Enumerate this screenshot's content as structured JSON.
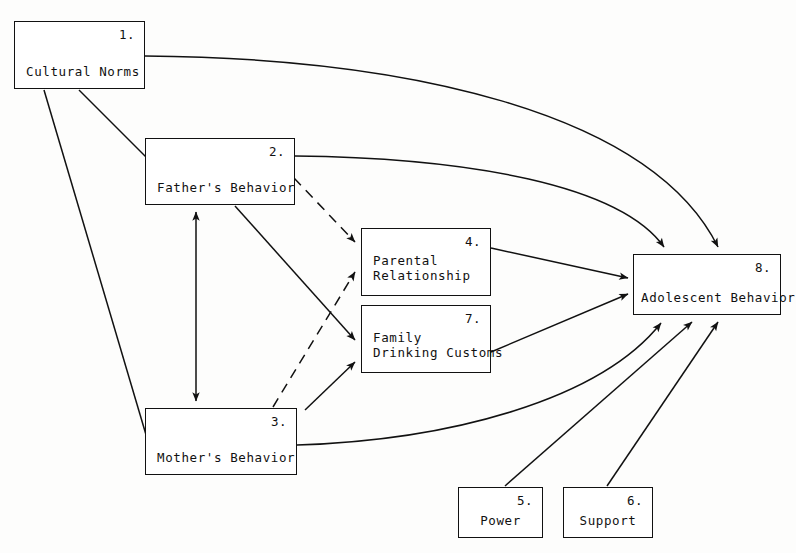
{
  "diagram": {
    "background_color": "#fdfdfc",
    "line_color": "#111111",
    "nodes": [
      {
        "id": "n1",
        "number": "1.",
        "label": "Cultural Norms",
        "x": 14,
        "y": 21,
        "w": 131,
        "h": 68
      },
      {
        "id": "n2",
        "number": "2.",
        "label": "Father's Behavior",
        "x": 145,
        "y": 138,
        "w": 150,
        "h": 67
      },
      {
        "id": "n3",
        "number": "3.",
        "label": "Mother's Behavior",
        "x": 145,
        "y": 408,
        "w": 152,
        "h": 67
      },
      {
        "id": "n4",
        "number": "4.",
        "label_line1": "Parental",
        "label_line2": "Relationship",
        "x": 361,
        "y": 228,
        "w": 130,
        "h": 68
      },
      {
        "id": "n7",
        "number": "7.",
        "label_line1": "Family",
        "label_line2": "Drinking Customs",
        "x": 361,
        "y": 305,
        "w": 130,
        "h": 68
      },
      {
        "id": "n5",
        "number": "5.",
        "label": "Power",
        "x": 458,
        "y": 487,
        "w": 85,
        "h": 51
      },
      {
        "id": "n6",
        "number": "6.",
        "label": "Support",
        "x": 563,
        "y": 487,
        "w": 90,
        "h": 51
      },
      {
        "id": "n8",
        "number": "8.",
        "label": "Adolescent Behavior",
        "x": 633,
        "y": 254,
        "w": 148,
        "h": 61
      }
    ],
    "edges": [
      {
        "from": "1",
        "to": "2",
        "style": "solid",
        "shape": "straight"
      },
      {
        "from": "1",
        "to": "3",
        "style": "solid",
        "shape": "straight"
      },
      {
        "from": "1",
        "to": "8",
        "style": "solid",
        "shape": "curved"
      },
      {
        "from": "2",
        "to": "8",
        "style": "solid",
        "shape": "curved"
      },
      {
        "from": "2",
        "to": "4",
        "style": "dashed",
        "shape": "straight"
      },
      {
        "from": "2",
        "to": "7",
        "style": "solid",
        "shape": "straight"
      },
      {
        "from": "3",
        "to": "4",
        "style": "dashed",
        "shape": "straight"
      },
      {
        "from": "3",
        "to": "7",
        "style": "solid",
        "shape": "straight"
      },
      {
        "from": "2",
        "to": "3",
        "style": "solid",
        "shape": "bidirectional"
      },
      {
        "from": "4",
        "to": "8",
        "style": "solid",
        "shape": "straight"
      },
      {
        "from": "7",
        "to": "8",
        "style": "solid",
        "shape": "straight"
      },
      {
        "from": "3",
        "to": "8",
        "style": "solid",
        "shape": "curved"
      },
      {
        "from": "5",
        "to": "8",
        "style": "solid",
        "shape": "straight"
      },
      {
        "from": "6",
        "to": "8",
        "style": "solid",
        "shape": "straight"
      }
    ]
  }
}
